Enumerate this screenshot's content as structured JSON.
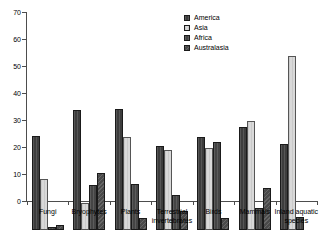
{
  "chart_data": {
    "type": "bar",
    "title": "",
    "subtitle": "",
    "xlabel": "",
    "ylabel": "",
    "ylim": [
      0,
      70
    ],
    "ytick_labels": [
      "0",
      "10",
      "20",
      "30",
      "40",
      "50",
      "60",
      "70"
    ],
    "ytick_values": [
      0,
      10,
      20,
      30,
      40,
      50,
      60,
      70
    ],
    "grid": false,
    "legend_position": "top-right",
    "categories": [
      "Fungi",
      "Bryophytes",
      "Plants",
      "Terrestrial invertebrates",
      "Birds",
      "Mammals",
      "Inland aquatic species"
    ],
    "series": [
      {
        "name": "America",
        "color": "#3d3d3d",
        "values": [
          35,
          44.5,
          45,
          31,
          34.5,
          38,
          32
        ]
      },
      {
        "name": "Asia",
        "color": "#d9d9d9",
        "values": [
          19,
          10,
          34.5,
          29.5,
          30.5,
          40.5,
          64.5
        ]
      },
      {
        "name": "Africa",
        "color": "#454545",
        "values": [
          1,
          16.5,
          17,
          13,
          32.5,
          8,
          5
        ]
      },
      {
        "name": "Australasia",
        "color": "#4a4a4a",
        "values": [
          2,
          21,
          4.5,
          7,
          4.5,
          15.5,
          0
        ]
      }
    ]
  },
  "legend": {
    "entries": [
      {
        "label": "America"
      },
      {
        "label": "Asia"
      },
      {
        "label": "Africa"
      },
      {
        "label": "Australasia"
      }
    ]
  }
}
